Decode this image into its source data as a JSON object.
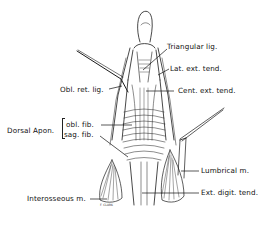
{
  "diagram": {
    "labels": {
      "triangular_lig": "Triangular lig.",
      "lat_ext_tend": "Lat. ext. tend.",
      "obl_ret_lig": "Obl. ret. lig.",
      "cent_ext_tend": "Cent. ext. tend.",
      "dorsal_apon": "Dorsal Apon.",
      "obl_fib": "obl. fib.",
      "sag_fib": "sag. fib.",
      "lumbrical_m": "Lumbrical m.",
      "interosseous_m": "Interosseous m.",
      "ext_digit_tend": "Ext. digit. tend."
    },
    "signature": "F. CLARK",
    "colors": {
      "line": "#111111",
      "background": "#ffffff"
    }
  }
}
